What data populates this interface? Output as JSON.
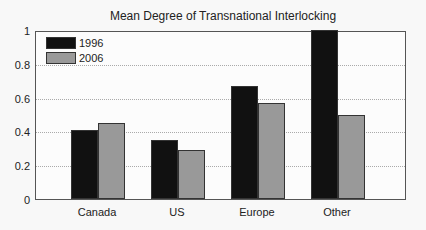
{
  "chart_data": {
    "type": "bar",
    "title": "Mean Degree of Transnational Interlocking",
    "xlabel": "",
    "ylabel": "",
    "categories": [
      "Canada",
      "US",
      "Europe",
      "Other"
    ],
    "series": [
      {
        "name": "1996",
        "color": "#111111",
        "values": [
          0.41,
          0.35,
          0.67,
          1.0
        ]
      },
      {
        "name": "2006",
        "color": "#999999",
        "values": [
          0.45,
          0.29,
          0.57,
          0.5
        ]
      }
    ],
    "ylim": [
      0,
      1
    ],
    "yticks": [
      "0",
      "0.2",
      "0.4",
      "0.6",
      "0.8",
      "1"
    ],
    "grid": "horizontal dotted",
    "legend_position": "top-left inside"
  }
}
